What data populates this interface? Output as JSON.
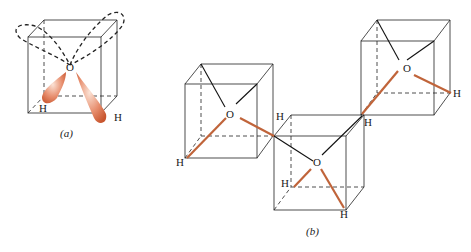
{
  "figure": {
    "panels": [
      {
        "id": "a",
        "caption": "(a)",
        "atom_labels": {
          "oxygen": "O",
          "h1": "H",
          "h2": "H"
        },
        "description": "Water molecule in a cube: O at center with two bonding orbitals (orange lobes) toward H atoms and two dashed lone-pair orbitals toward upper corners"
      },
      {
        "id": "b",
        "caption": "(b)",
        "molecules": [
          {
            "oxygen": "O",
            "hydrogens": [
              "H",
              "H"
            ]
          },
          {
            "oxygen": "O",
            "hydrogens": [
              "H",
              "H"
            ]
          },
          {
            "oxygen": "O",
            "hydrogens": [
              "H",
              "H"
            ]
          }
        ],
        "description": "Three water molecules in cubes linked by hydrogen bonds (orange = O–H covalent bonds, black = hydrogen bonds)"
      }
    ],
    "colors": {
      "bond": "#c0643a",
      "orbital_fill": "#d9764a",
      "line": "#222222"
    }
  }
}
